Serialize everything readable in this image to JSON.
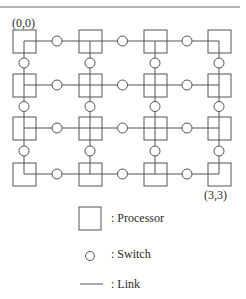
{
  "figure": {
    "type": "mesh-network-diagram",
    "grid": {
      "rows": 4,
      "cols": 4
    },
    "corner_labels": {
      "top_left": "(0,0)",
      "bottom_right": "(3,3)"
    },
    "legend": [
      {
        "symbol": "square",
        "label": ": Processor"
      },
      {
        "symbol": "circle",
        "label": ": Switch"
      },
      {
        "symbol": "line",
        "label": ": Link"
      }
    ],
    "colors": {
      "stroke": "#555555",
      "text": "#2a2a2a",
      "background": "#ffffff"
    }
  }
}
